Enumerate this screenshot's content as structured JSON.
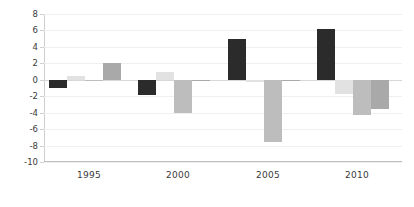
{
  "chart_data": {
    "type": "bar",
    "title": "",
    "subtitle": "",
    "xlabel": "",
    "ylabel": "",
    "categories": [
      "1995",
      "2000",
      "2005",
      "2010"
    ],
    "ylim": [
      -10,
      8
    ],
    "yticks": [
      8,
      6,
      4,
      2,
      0,
      -2,
      -4,
      -6,
      -8,
      -10
    ],
    "ytick_labels": [
      "8",
      "6",
      "4",
      "2",
      "0",
      "-2",
      "-4",
      "-6",
      "-8",
      "-10"
    ],
    "grid": true,
    "legend": "none",
    "orientation": "vertical",
    "series": [
      {
        "name": "Series 1",
        "color": "#2b2b2b",
        "values": [
          -1.0,
          -1.8,
          5.0,
          6.2
        ]
      },
      {
        "name": "Series 2",
        "color": "#e2e2e2",
        "values": [
          0.4,
          1.0,
          -0.3,
          -1.7
        ]
      },
      {
        "name": "Series 3",
        "color": "#bdbdbd",
        "values": [
          -0.2,
          -4.0,
          -7.6,
          -4.3
        ]
      },
      {
        "name": "Series 4",
        "color": "#a9a9a9",
        "values": [
          2.0,
          -0.15,
          -0.2,
          -3.5
        ]
      }
    ]
  }
}
